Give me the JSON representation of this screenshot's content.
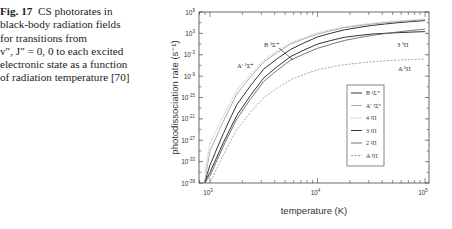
{
  "caption": {
    "label": "Fig. 17",
    "lines": [
      "CS photorates in",
      "black-body radiation fields",
      "for transitions from",
      "v″, J″ = 0, 0 to each excited",
      "electronic state as a function",
      "of radiation temperature [70]"
    ]
  },
  "chart_data": {
    "type": "line",
    "title": "",
    "xlabel": "temperature (K)",
    "ylabel": "photodissociation rate (s⁻¹)",
    "xscale": "log",
    "yscale": "log",
    "xlim": [
      800,
      110000
    ],
    "ylim": [
      1e-39,
      1000000000.0
    ],
    "x_ticks": [
      "10^3",
      "10^4",
      "10^5"
    ],
    "y_ticks": [
      "10^9",
      "10^3",
      "10^-3",
      "10^-9",
      "10^-15",
      "10^-21",
      "10^-27",
      "10^-33",
      "10^-39"
    ],
    "grid": false,
    "legend_position": "center-right",
    "x_log10": [
      2.95,
      3.0,
      3.25,
      3.5,
      3.75,
      4.0,
      4.25,
      4.5,
      4.75,
      5.0
    ],
    "series": [
      {
        "name": "B ¹Σ⁺",
        "style": "solid-dark",
        "y_log10": [
          -39,
          -34,
          -17,
          -7,
          -1.5,
          2.0,
          4.0,
          5.2,
          6.0,
          6.6
        ]
      },
      {
        "name": "A′ ¹Σ⁺",
        "style": "solid-light",
        "y_log10": [
          -39,
          -30,
          -14,
          -5,
          0,
          2.8,
          4.6,
          5.6,
          6.3,
          6.8
        ]
      },
      {
        "name": "4 ¹Π",
        "style": "dotted-light",
        "y_log10": [
          -36,
          -28,
          -13,
          -4.5,
          0.3,
          3.2,
          4.8,
          5.8,
          6.5,
          7.0
        ]
      },
      {
        "name": "3 ¹Π",
        "style": "solid-dark",
        "y_log10": [
          -39,
          -36,
          -20,
          -9.5,
          -3.5,
          0.0,
          1.9,
          2.8,
          3.2,
          3.5
        ]
      },
      {
        "name": "2 ¹Π",
        "style": "solid-mid",
        "y_log10": [
          -39,
          -37,
          -21,
          -10.5,
          -4.5,
          -1.2,
          1.0,
          2.4,
          3.4,
          4.2
        ]
      },
      {
        "name": "A ¹Π",
        "style": "dashed-light",
        "y_log10": [
          -39,
          -39,
          -24,
          -15,
          -10,
          -7.2,
          -5.8,
          -5.0,
          -4.5,
          -4.2
        ]
      }
    ],
    "annotations": [
      "B ¹Σ⁺",
      "A′ ¹Σ⁺",
      "3 ¹Π",
      "A ¹Π"
    ]
  }
}
